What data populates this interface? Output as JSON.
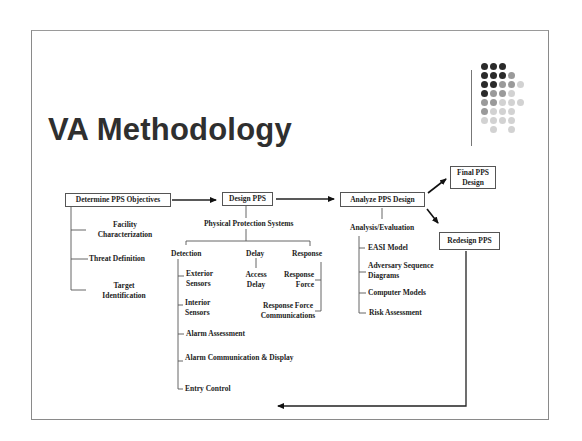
{
  "slide": {
    "title": "VA Methodology",
    "decor": {
      "dot_pattern": [
        "DDD",
        "DDDM",
        "DDMML",
        "DMML",
        "MMLLL",
        "MLLL",
        "LLLL",
        "_L_L"
      ],
      "dot_colors": {
        "D": "#2b2b2b",
        "M": "#9a9a9a",
        "L": "#d2d2d2"
      }
    }
  },
  "diagram": {
    "steps": {
      "determine": "Determine PPS Objectives",
      "design": "Design PPS",
      "analyze": "Analyze PPS Design",
      "final": "Final PPS Design",
      "redesign": "Redesign PPS"
    },
    "objectives": [
      "Facility Characterization",
      "Threat Definition",
      "Target Identification"
    ],
    "pps": {
      "label": "Physical Protection Systems",
      "detection": {
        "label": "Detection",
        "items": [
          "Exterior Sensors",
          "Interior Sensors",
          "Alarm Assessment",
          "Alarm Communication & Display",
          "Entry Control"
        ]
      },
      "delay": {
        "label": "Delay",
        "items": [
          "Access Delay"
        ]
      },
      "response": {
        "label": "Response",
        "items": [
          "Response Force",
          "Response Force Communications"
        ]
      }
    },
    "analysis": {
      "label": "Analysis/Evaluation",
      "items": [
        "EASI Model",
        "Adversary Sequence Diagrams",
        "Computer Models",
        "Risk Assessment"
      ]
    }
  }
}
